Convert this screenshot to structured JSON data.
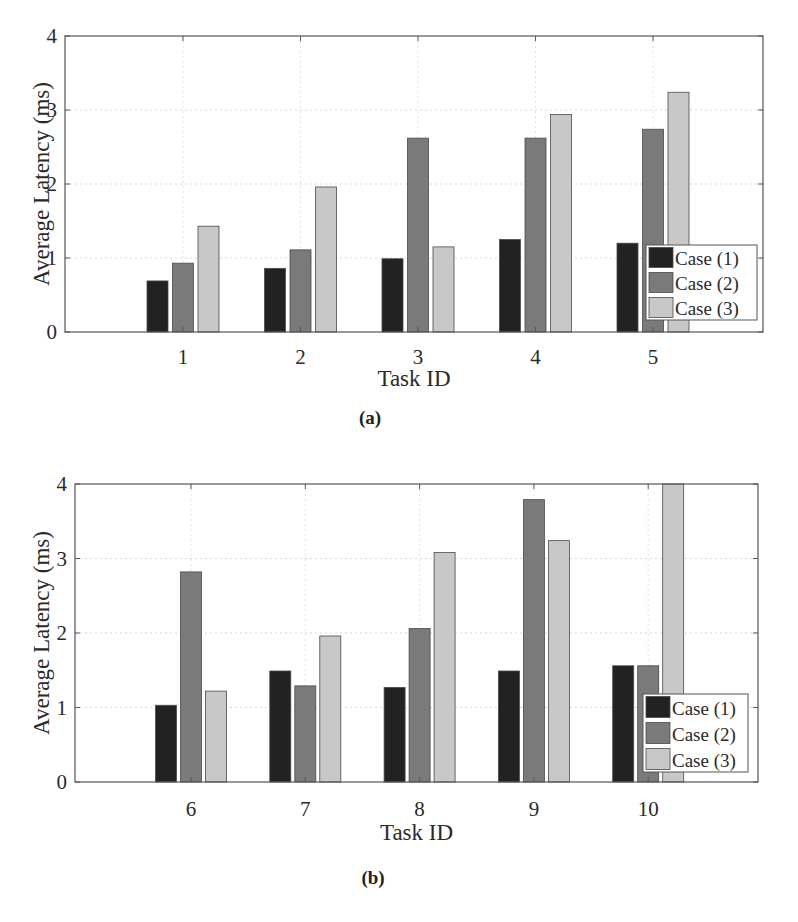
{
  "chart_data": [
    {
      "id": "a",
      "type": "bar",
      "caption": "(a)",
      "title": "",
      "xlabel": "Task ID",
      "ylabel": "Average Latency (ms)",
      "ylim": [
        0,
        4
      ],
      "yticks": [
        0,
        1,
        2,
        3,
        4
      ],
      "grid": true,
      "legend_position": "lower right",
      "categories": [
        "1",
        "2",
        "3",
        "4",
        "5"
      ],
      "series": [
        {
          "name": "Case (1)",
          "color": "#222222",
          "values": [
            0.69,
            0.86,
            0.99,
            1.25,
            1.2
          ]
        },
        {
          "name": "Case (2)",
          "color": "#7a7a7a",
          "values": [
            0.93,
            1.11,
            2.62,
            2.62,
            2.74
          ]
        },
        {
          "name": "Case (3)",
          "color": "#c8c8c8",
          "values": [
            1.43,
            1.96,
            1.15,
            2.94,
            3.24
          ]
        }
      ]
    },
    {
      "id": "b",
      "type": "bar",
      "caption": "(b)",
      "title": "",
      "xlabel": "Task ID",
      "ylabel": "Average Latency (ms)",
      "ylim": [
        0,
        4
      ],
      "yticks": [
        0,
        1,
        2,
        3,
        4
      ],
      "grid": true,
      "legend_position": "lower right",
      "categories": [
        "6",
        "7",
        "8",
        "9",
        "10"
      ],
      "series": [
        {
          "name": "Case (1)",
          "color": "#222222",
          "values": [
            1.03,
            1.49,
            1.27,
            1.49,
            1.56
          ]
        },
        {
          "name": "Case (2)",
          "color": "#7a7a7a",
          "values": [
            2.82,
            1.29,
            2.06,
            3.79,
            1.56
          ]
        },
        {
          "name": "Case (3)",
          "color": "#c8c8c8",
          "values": [
            1.22,
            1.96,
            3.08,
            3.24,
            4.0
          ]
        }
      ]
    }
  ]
}
